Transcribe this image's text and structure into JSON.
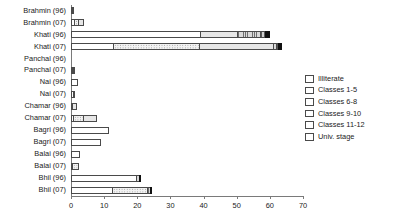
{
  "chart_data": {
    "type": "bar",
    "orientation": "horizontal",
    "stacked": true,
    "title": "",
    "xlabel": "",
    "ylabel": "",
    "xlim": [
      0,
      70
    ],
    "xticks": [
      0,
      10,
      20,
      30,
      40,
      50,
      60,
      70
    ],
    "grid": false,
    "legend_position": "right",
    "categories": [
      "Brahmin  (96)",
      "Brahmin  (07)",
      "Khati  (96)",
      "Khati  (07)",
      "Panchal  (96)",
      "Panchal  (07)",
      "Nai  (96)",
      "Nai  (07)",
      "Chamar  (96)",
      "Chamar  (07)",
      "Bagri  (96)",
      "Bagri  (07)",
      "Balai  (96)",
      "Balai  (07)",
      "Bhil  (96)",
      "Bhil  (07)"
    ],
    "series": [
      {
        "name": "Illiterate",
        "pattern": "blank",
        "values": [
          0.4,
          1.0,
          39.0,
          12.7,
          0.0,
          0.5,
          2.0,
          0.8,
          0.4,
          0.6,
          11.5,
          9.0,
          2.6,
          0.2,
          19.8,
          12.5
        ]
      },
      {
        "name": "Classes 1-5",
        "pattern": "dots-sparse",
        "values": [
          0.0,
          1.0,
          0.0,
          25.8,
          0.0,
          0.2,
          0.0,
          0.3,
          0.0,
          3.0,
          0.0,
          0.0,
          0.0,
          2.3,
          0.0,
          10.6
        ]
      },
      {
        "name": "Classes 6-8",
        "pattern": "dots-dense",
        "values": [
          0.0,
          2.0,
          11.0,
          22.5,
          0.0,
          0.0,
          0.0,
          0.0,
          1.5,
          4.3,
          0.0,
          0.0,
          0.0,
          0.0,
          0.0,
          0.0
        ]
      },
      {
        "name": "Classes 9-10",
        "pattern": "grid",
        "values": [
          0.3,
          0.0,
          7.0,
          1.0,
          0.0,
          0.3,
          0.0,
          0.0,
          0.0,
          0.0,
          0.0,
          0.0,
          0.0,
          0.0,
          0.9,
          1.0
        ]
      },
      {
        "name": "Classes 11-12",
        "pattern": "vlines",
        "values": [
          0.0,
          0.0,
          1.5,
          0.5,
          0.0,
          0.0,
          0.0,
          0.0,
          0.0,
          0.0,
          0.0,
          0.0,
          0.0,
          0.0,
          0.0,
          0.0
        ]
      },
      {
        "name": "Univ. stage",
        "pattern": "solid-black",
        "values": [
          0.0,
          0.0,
          1.5,
          1.3,
          0.0,
          0.0,
          0.0,
          0.0,
          0.0,
          0.0,
          0.0,
          0.0,
          0.0,
          0.0,
          0.3,
          0.4
        ]
      }
    ]
  },
  "legend": {
    "items": [
      {
        "label": "Illiterate",
        "pattern": "blank"
      },
      {
        "label": "Classes 1-5",
        "pattern": "dots-sparse"
      },
      {
        "label": "Classes 6-8",
        "pattern": "dots-dense"
      },
      {
        "label": "Classes 9-10",
        "pattern": "grid"
      },
      {
        "label": "Classes 11-12",
        "pattern": "vlines"
      },
      {
        "label": "Univ. stage",
        "pattern": "solid-black"
      }
    ]
  },
  "colors": {
    "axis": "#7a7a7a",
    "bar_outline": "#4a4a4a",
    "text": "#1a1a1a",
    "univ_stage": "#111111",
    "background": "#ffffff"
  }
}
